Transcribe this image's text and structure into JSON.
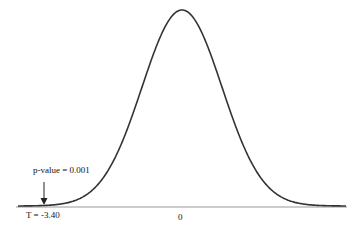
{
  "chart_data": {
    "type": "line",
    "title": "",
    "xlabel": "",
    "ylabel": "",
    "x_tick_labels": [
      "0"
    ],
    "grid": false,
    "series": [
      {
        "name": "density",
        "shape": "bell curve centered at 0"
      }
    ],
    "annotations": [
      {
        "text": "p-value = 0.001",
        "points_to": "left tail at T = -3.40"
      },
      {
        "text": "T = -3.40",
        "position": "below axis at left tail"
      }
    ],
    "test_statistic": -3.4,
    "p_value": 0.001
  },
  "labels": {
    "pvalue": "p-value = 0.001",
    "tstat": "T = -3.40",
    "zero": "0"
  }
}
